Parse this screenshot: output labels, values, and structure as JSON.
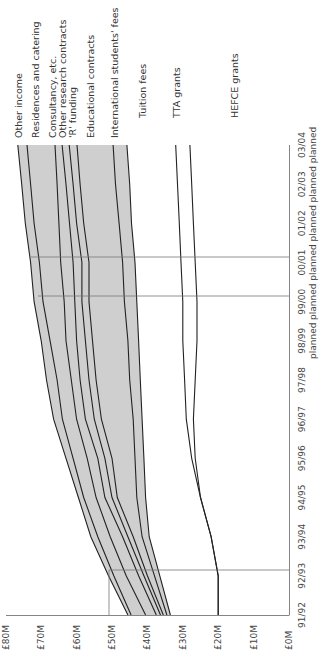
{
  "chart_data": {
    "type": "area",
    "orientation": "rotated-90-ccw",
    "title": "",
    "xlabel": "",
    "ylabel": "",
    "ylim": [
      0,
      80
    ],
    "grid": false,
    "categories": [
      "91/92",
      "92/93",
      "93/94",
      "94/95",
      "95/96",
      "96/97",
      "97/98",
      "98/99",
      "99/00",
      "00/01",
      "01/02",
      "02/03",
      "03/04"
    ],
    "category_sublabels": [
      "",
      "",
      "",
      "",
      "",
      "",
      "",
      "planned",
      "planned",
      "planned",
      "planned",
      "planned",
      "planned"
    ],
    "y_ticks": [
      "£0M",
      "£10M",
      "£20M",
      "£30M",
      "£40M",
      "£50M",
      "£60M",
      "£70M",
      "£80M"
    ],
    "series_note": "Cumulative (stacked) income levels in £M; each value is the top edge of that band.",
    "series": [
      {
        "name": "HEFCE grants",
        "values": [
          20,
          20,
          22,
          25,
          27.5,
          29,
          29.5,
          30,
          30,
          30.5,
          31,
          31.5,
          32
        ]
      },
      {
        "name": "TTA grants",
        "values": [
          20,
          20,
          22,
          25,
          26.5,
          27,
          26.5,
          26,
          26,
          26.5,
          27,
          27.5,
          28
        ]
      },
      {
        "name": "Tuition fees",
        "values": [
          20,
          20,
          22,
          25,
          26.5,
          27,
          26.5,
          26,
          26,
          26.5,
          27,
          27.5,
          28
        ]
      },
      {
        "name": "International students' fees",
        "values": [
          33.5,
          36.5,
          39.5,
          40.5,
          41,
          41.5,
          42,
          42.5,
          43,
          43.5,
          44.5,
          45,
          45.8
        ]
      },
      {
        "name": "Educational contracts",
        "values": [
          34.5,
          38,
          41.5,
          43,
          43.5,
          44,
          45,
          45.5,
          46.5,
          47,
          48,
          49,
          49.7
        ]
      },
      {
        "name": "'R' funding",
        "values": [
          35.5,
          40,
          44,
          48.5,
          50,
          53,
          54.5,
          55.5,
          56.5,
          56.5,
          58,
          59,
          59.9
        ]
      },
      {
        "name": "Other research contracts",
        "values": [
          36.3,
          41,
          45.5,
          50,
          52,
          55,
          56.5,
          57.5,
          58.5,
          58.5,
          60,
          61,
          62.1
        ]
      },
      {
        "name": "Consultancy, etc.",
        "values": [
          37.5,
          42.5,
          47,
          52,
          54,
          57.5,
          59,
          60,
          60.5,
          61,
          62,
          63,
          64.1
        ]
      },
      {
        "name": "Residences and catering",
        "values": [
          40.5,
          46,
          50.5,
          54.5,
          57,
          60,
          61.5,
          63,
          63.5,
          64.5,
          65,
          65.5,
          66.1
        ]
      },
      {
        "name": "Other income top (lower edge)",
        "values": [
          44.6,
          49.5,
          54,
          58,
          61,
          64,
          65.5,
          67.5,
          69.5,
          70.5,
          72,
          73,
          74
        ]
      },
      {
        "name": "Other income",
        "values": [
          45.5,
          51,
          56,
          59.5,
          63,
          66.5,
          68.5,
          70,
          72,
          73,
          74.5,
          75.5,
          76.6
        ]
      }
    ],
    "legend": [
      "Other income",
      "Residences and catering",
      "Consultancy, etc.",
      "Other research contracts",
      "'R' funding",
      "Educational contracts",
      "International students' fees",
      "Tuition fees",
      "TTA grants",
      "HEFCE grants"
    ],
    "legend_position": "inline-end-labels",
    "reference_lines": [
      {
        "at_category": "92/93",
        "to_value": 50
      },
      {
        "at_category": "99/00"
      },
      {
        "at_category": "00/01"
      }
    ]
  },
  "labels": {
    "other_income": "Other income",
    "residences": "Residences and catering",
    "consultancy": "Consultancy, etc.",
    "other_research": "Other research contracts",
    "r_funding": "'R' funding",
    "educational": "Educational contracts",
    "international": "International students' fees",
    "tuition": "Tuition fees",
    "tta": "TTA grants",
    "hefce": "HEFCE grants"
  },
  "axis": {
    "y_ticks": [
      "£80M",
      "£70M",
      "£60M",
      "£50M",
      "£40M",
      "£30M",
      "£20M",
      "£10M",
      "£0M"
    ],
    "x_ticks": [
      "91/92",
      "92/93",
      "93/94",
      "94/95",
      "95/96",
      "96/97",
      "97/98",
      "98/99",
      "99/00",
      "00/01",
      "01/02",
      "02/03",
      "03/04"
    ],
    "planned": "planned"
  }
}
